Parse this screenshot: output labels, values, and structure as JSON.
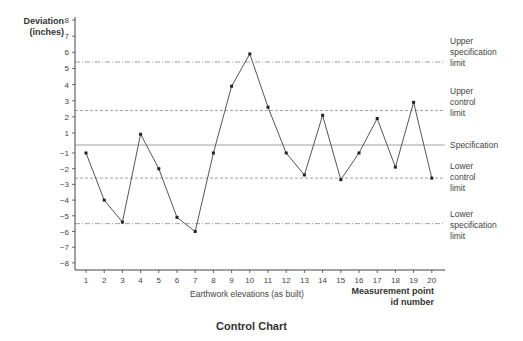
{
  "chart_data": {
    "type": "line",
    "title": "Control Chart",
    "ylabel": "Deviation (inches)",
    "ylabel_lines": [
      "Deviation",
      "(inches)"
    ],
    "xlabel": "Earthwork elevations (as built)",
    "xlabel_right_lines": [
      "Measurement point",
      "id number"
    ],
    "y_ticks": [
      8,
      7,
      6,
      5,
      4,
      3,
      2,
      1,
      -1,
      -2,
      -3,
      -4,
      -5,
      -6,
      -7,
      -8
    ],
    "ylim": [
      -8,
      8
    ],
    "x": [
      1,
      2,
      3,
      4,
      5,
      6,
      7,
      8,
      9,
      10,
      11,
      12,
      13,
      14,
      15,
      16,
      17,
      18,
      19,
      20
    ],
    "series": [
      {
        "name": "Measured deviation",
        "values": [
          -1,
          -4,
          -5.4,
          0.9,
          -2,
          -5.1,
          -6,
          -1,
          3.9,
          5.9,
          2.6,
          -1,
          -2.4,
          2.1,
          -2.7,
          -1,
          1.9,
          -1.9,
          2.9,
          -2.6
        ]
      }
    ],
    "reference_lines": [
      {
        "name": "Upper specification limit",
        "value": 5.4,
        "style": "dashdot",
        "label_lines": [
          "Upper",
          "specification",
          "limit"
        ]
      },
      {
        "name": "Upper control limit",
        "value": 2.4,
        "style": "dashed",
        "label_lines": [
          "Upper",
          "control",
          "limit"
        ]
      },
      {
        "name": "Specification",
        "value": 0,
        "style": "solid",
        "label_lines": [
          "Specification"
        ]
      },
      {
        "name": "Lower control limit",
        "value": -2.6,
        "style": "dashed",
        "label_lines": [
          "Lower",
          "control",
          "limit"
        ]
      },
      {
        "name": "Lower specification limit",
        "value": -5.5,
        "style": "dashdot",
        "label_lines": [
          "Lower",
          "specification",
          "limit"
        ]
      }
    ],
    "grid": false,
    "legend": "none (limit lines labeled at right)"
  },
  "colors": {
    "line": "#555555",
    "marker": "#222222",
    "axis": "#444444",
    "reference": "#888888",
    "text": "#444444"
  }
}
